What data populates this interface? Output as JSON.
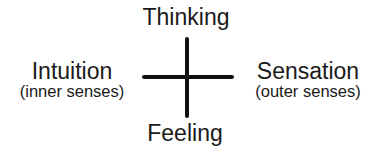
{
  "diagram": {
    "top": {
      "label": "Thinking"
    },
    "bottom": {
      "label": "Feeling"
    },
    "left": {
      "label": "Intuition",
      "sublabel": "(inner senses)"
    },
    "right": {
      "label": "Sensation",
      "sublabel": "(outer senses)"
    }
  },
  "colors": {
    "line": "#111111",
    "text": "#1a1a1a",
    "background": "#ffffff"
  }
}
